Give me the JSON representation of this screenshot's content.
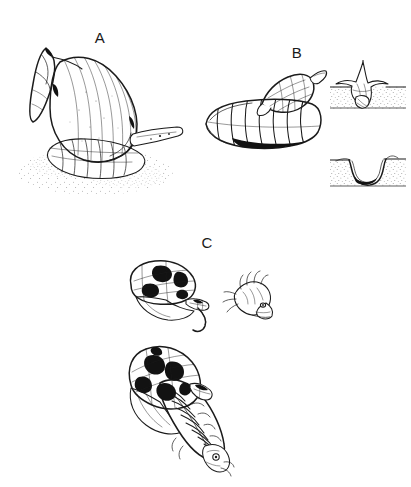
{
  "figure": {
    "kind": "scientific-line-drawing",
    "medium": "pen-and-ink",
    "background_color": "#ffffff",
    "ink_color": "#1b1b1b",
    "width": 411,
    "height": 487,
    "panel_count": 3
  },
  "labels": {
    "a": "A",
    "b": "B",
    "c": "C"
  },
  "panels": [
    {
      "id": "a",
      "label": "A",
      "label_x": 100,
      "label_y": 43,
      "caption_text": "A",
      "description": "Large high-spired snail in lateral view with extended foot on stippled sand substrate and a siphon projecting to the right",
      "elements": [
        "snail-shell-spire",
        "snail-body-whorl",
        "snail-foot",
        "snail-siphon",
        "sand-substrate-stipple"
      ]
    },
    {
      "id": "b",
      "label": "B",
      "label_x": 297,
      "label_y": 58,
      "caption_text": "B",
      "description": "Dark reticulate-patterned gastropod resting atop a transversely ribbed shell",
      "elements": [
        "patterned-gastropod",
        "ribbed-host-shell"
      ]
    },
    {
      "id": "c",
      "label": "C",
      "label_x": 207,
      "label_y": 248,
      "caption_text": "C",
      "description": "Blotched limpet-like shell over a segmented animal with tail, a separate enlarged head detail, and a dorsal view of the whole segmented animal",
      "elements": [
        "blotched-shell-lateral",
        "animal-tail-filament",
        "head-detail",
        "segmented-animal-dorsal"
      ]
    }
  ],
  "insets": [
    {
      "id": "burrow-occupied",
      "x": 330,
      "y": 60,
      "width": 76,
      "height": 50,
      "description": "Cross-section of sediment with animal in burrow, siphon reaching the surface",
      "sediment_fill": "stipple"
    },
    {
      "id": "burrow-empty",
      "x": 330,
      "y": 148,
      "width": 76,
      "height": 44,
      "description": "Cross-section of the empty U-shaped burrow trace left in the sediment",
      "sediment_fill": "stipple"
    }
  ]
}
